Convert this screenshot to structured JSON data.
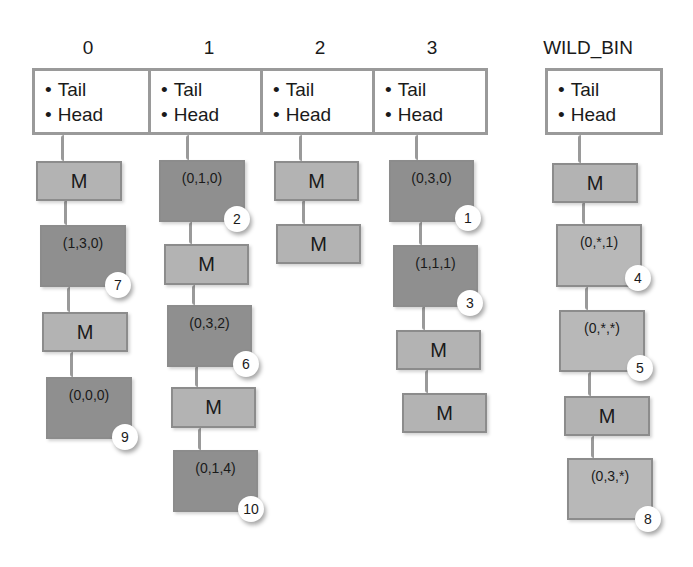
{
  "bins": [
    {
      "label": "0",
      "fields": [
        "Tail",
        "Head"
      ],
      "chain": [
        {
          "text": "M",
          "kind": "m"
        },
        {
          "text": "(1,3,0)",
          "kind": "dark",
          "order": "7"
        },
        {
          "text": "M",
          "kind": "m"
        },
        {
          "text": "(0,0,0)",
          "kind": "dark",
          "order": "9"
        }
      ]
    },
    {
      "label": "1",
      "fields": [
        "Tail",
        "Head"
      ],
      "chain": [
        {
          "text": "(0,1,0)",
          "kind": "dark",
          "order": "2"
        },
        {
          "text": "M",
          "kind": "m"
        },
        {
          "text": "(0,3,2)",
          "kind": "dark",
          "order": "6"
        },
        {
          "text": "M",
          "kind": "m"
        },
        {
          "text": "(0,1,4)",
          "kind": "dark",
          "order": "10"
        }
      ]
    },
    {
      "label": "2",
      "fields": [
        "Tail",
        "Head"
      ],
      "chain": [
        {
          "text": "M",
          "kind": "m"
        },
        {
          "text": "M",
          "kind": "m"
        }
      ]
    },
    {
      "label": "3",
      "fields": [
        "Tail",
        "Head"
      ],
      "chain": [
        {
          "text": "(0,3,0)",
          "kind": "dark",
          "order": "1"
        },
        {
          "text": "(1,1,1)",
          "kind": "dark",
          "order": "3"
        },
        {
          "text": "M",
          "kind": "m"
        },
        {
          "text": "M",
          "kind": "m"
        }
      ]
    },
    {
      "label": "WILD_BIN",
      "fields": [
        "Tail",
        "Head"
      ],
      "chain": [
        {
          "text": "M",
          "kind": "m"
        },
        {
          "text": "(0,*,1)",
          "kind": "light",
          "order": "4"
        },
        {
          "text": "(0,*,*)",
          "kind": "light",
          "order": "5"
        },
        {
          "text": "M",
          "kind": "m"
        },
        {
          "text": "(0,3,*)",
          "kind": "light",
          "order": "8"
        }
      ]
    }
  ],
  "colors": {
    "header_border": "#9a9a9a",
    "marker_fill": "#b3b3b3",
    "matched_fill": "#8f8f8f",
    "wild_fill": "#b8b8b8",
    "badge_fill": "#ffffff"
  }
}
